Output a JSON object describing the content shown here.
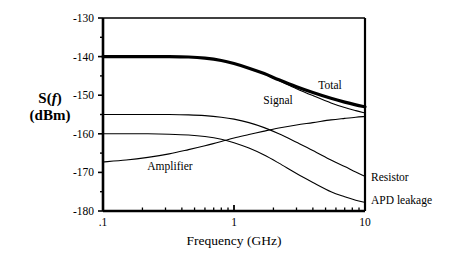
{
  "chart_data": {
    "type": "line",
    "title": "",
    "xlabel": "Frequency (GHz)",
    "ylabel_main": "S(",
    "ylabel_italic": "f",
    "ylabel_close": ")",
    "ylabel_units": "(dBm)",
    "xscale": "log",
    "xlim": [
      0.1,
      10
    ],
    "ylim": [
      -180,
      -130
    ],
    "grid": false,
    "legend_position": "inline-annotations",
    "x_tick_labels": [
      ".1",
      "1",
      "10"
    ],
    "x_tick_values": [
      0.1,
      1,
      10
    ],
    "y_tick_labels": [
      "-130",
      "-140",
      "-150",
      "-160",
      "-170",
      "-180"
    ],
    "y_tick_values": [
      -130,
      -140,
      -150,
      -160,
      -170,
      -180
    ],
    "y_minor_tick_values": [
      -135,
      -145,
      -155,
      -165,
      -175
    ],
    "series": [
      {
        "name": "Total",
        "label": "Total",
        "linewidth": "thick",
        "label_x": 330,
        "label_y": 89,
        "x": [
          0.1,
          0.15,
          0.22,
          0.32,
          0.45,
          0.6,
          0.8,
          1.0,
          1.3,
          1.7,
          2.2,
          3.0,
          4.0,
          5.5,
          7.0,
          8.5,
          10.0
        ],
        "y": [
          -140.0,
          -140.0,
          -140.0,
          -140.0,
          -140.1,
          -140.4,
          -141.0,
          -141.8,
          -143.0,
          -144.4,
          -146.0,
          -147.8,
          -149.3,
          -150.8,
          -151.8,
          -152.5,
          -153.0
        ]
      },
      {
        "name": "Signal",
        "label": "Signal",
        "linewidth": "thin",
        "label_x": 278,
        "label_y": 104,
        "x": [
          0.1,
          0.15,
          0.22,
          0.32,
          0.45,
          0.6,
          0.8,
          1.0,
          1.3,
          1.7,
          2.2,
          3.0,
          4.0,
          5.5,
          7.0,
          8.5,
          10.0
        ],
        "y": [
          -140.0,
          -140.0,
          -140.0,
          -140.0,
          -140.1,
          -140.4,
          -141.0,
          -141.8,
          -143.0,
          -144.5,
          -146.2,
          -148.3,
          -150.1,
          -152.0,
          -153.2,
          -154.0,
          -154.6
        ]
      },
      {
        "name": "Amplifier",
        "label": "Amplifier",
        "linewidth": "thin",
        "label_x": 170,
        "label_y": 170,
        "x": [
          0.1,
          0.15,
          0.22,
          0.32,
          0.45,
          0.6,
          0.8,
          1.0,
          1.3,
          1.7,
          2.2,
          3.0,
          4.0,
          5.5,
          7.0,
          8.5,
          10.0
        ],
        "y": [
          -167.3,
          -166.8,
          -166.1,
          -165.2,
          -164.1,
          -163.1,
          -162.0,
          -161.1,
          -160.2,
          -159.3,
          -158.5,
          -157.7,
          -157.1,
          -156.4,
          -156.0,
          -155.7,
          -155.5
        ]
      },
      {
        "name": "Resistor",
        "label": "Resistor",
        "linewidth": "thin",
        "label_x": 371,
        "label_y": 181,
        "x": [
          0.1,
          0.15,
          0.22,
          0.32,
          0.45,
          0.6,
          0.8,
          1.0,
          1.3,
          1.7,
          2.2,
          3.0,
          4.0,
          5.5,
          7.0,
          8.5,
          10.0
        ],
        "y": [
          -155.0,
          -155.0,
          -155.0,
          -155.0,
          -155.1,
          -155.3,
          -155.7,
          -156.2,
          -157.1,
          -158.4,
          -160.0,
          -162.2,
          -164.3,
          -166.8,
          -168.5,
          -169.9,
          -171.0
        ]
      },
      {
        "name": "APD leakage",
        "label": "APD leakage",
        "linewidth": "thin",
        "label_x": 371,
        "label_y": 204,
        "x": [
          0.1,
          0.15,
          0.22,
          0.32,
          0.45,
          0.6,
          0.8,
          1.0,
          1.3,
          1.7,
          2.2,
          3.0,
          4.0,
          5.5,
          7.0,
          8.5,
          10.0
        ],
        "y": [
          -160.0,
          -160.0,
          -160.0,
          -160.1,
          -160.3,
          -160.7,
          -161.4,
          -162.3,
          -163.7,
          -165.5,
          -167.6,
          -170.3,
          -172.6,
          -175.0,
          -176.3,
          -177.2,
          -177.8
        ]
      }
    ]
  },
  "plot": {
    "left_px": 103,
    "right_px": 365,
    "top_px": 18,
    "bottom_px": 211
  }
}
